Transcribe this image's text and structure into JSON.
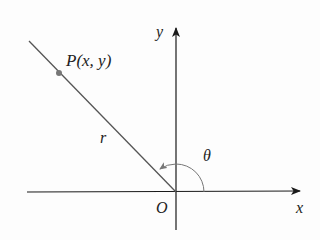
{
  "diagram": {
    "labels": {
      "point": "P(x, y)",
      "radius": "r",
      "angle": "θ",
      "origin": "O",
      "x_axis": "x",
      "y_axis": "y"
    },
    "colors": {
      "axis": "#1a1a1a",
      "ray": "#555555",
      "arc": "#777777",
      "point": "#777777",
      "text": "#222222"
    }
  }
}
